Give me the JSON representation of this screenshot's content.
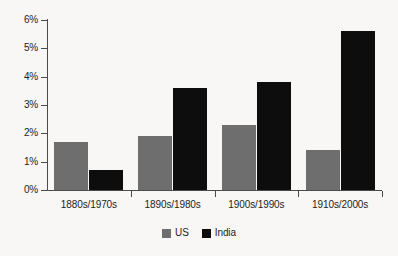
{
  "chart_data": {
    "type": "bar",
    "title": "",
    "subtitle": "",
    "xlabel": "",
    "ylabel": "",
    "categories": [
      "1880s/1970s",
      "1890s/1980s",
      "1900s/1990s",
      "1910s/2000s"
    ],
    "series": [
      {
        "name": "US",
        "color": "#6e6e6e",
        "values": [
          1.7,
          1.9,
          2.3,
          1.4
        ]
      },
      {
        "name": "India",
        "color": "#0d0d0d",
        "values": [
          0.7,
          3.6,
          3.8,
          5.6
        ]
      }
    ],
    "ylim": [
      0,
      6
    ],
    "ytick_values": [
      0,
      1,
      2,
      3,
      4,
      5,
      6
    ],
    "ytick_labels": [
      "0%",
      "1%",
      "2%",
      "3%",
      "4%",
      "5%",
      "6%"
    ],
    "grid": false,
    "legend_position": "bottom-center",
    "value_suffix": "%"
  },
  "legend": {
    "entries": [
      {
        "label": "US",
        "swatch": "gray-square-icon"
      },
      {
        "label": "India",
        "swatch": "black-square-icon"
      }
    ]
  },
  "axes": {
    "y_axis_name": "percentage-axis",
    "x_axis_name": "decade-pair-axis"
  },
  "colors": {
    "background": "#f8f7f5",
    "axis": "#4a4a4a",
    "text": "#1d1d1b",
    "series_us": "#6e6e6e",
    "series_india": "#0d0d0d"
  }
}
